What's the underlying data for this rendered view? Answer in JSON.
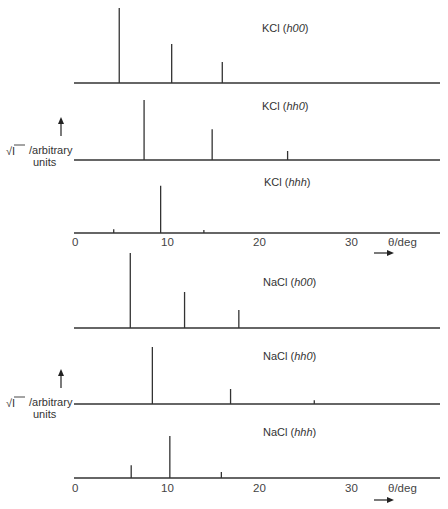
{
  "figure": {
    "y_axis_label_symbol": "√I",
    "y_axis_label_text": "/arbitrary",
    "y_axis_label_units": "units",
    "x_axis_label": "θ/deg",
    "x_ticks": [
      "0",
      "10",
      "20",
      "30"
    ]
  },
  "chart_data": [
    {
      "type": "bar",
      "title": "KCl (h00)",
      "group": "KCl",
      "xlabel": "θ/deg",
      "ylabel": "√I /arbitrary units",
      "xlim": [
        0,
        40
      ],
      "peaks": [
        {
          "theta": 4.7,
          "amplitude": 1.0
        },
        {
          "theta": 10.4,
          "amplitude": 0.52
        },
        {
          "theta": 15.9,
          "amplitude": 0.28
        }
      ]
    },
    {
      "type": "bar",
      "title": "KCl (hh0)",
      "group": "KCl",
      "xlabel": "θ/deg",
      "ylabel": "√I /arbitrary units",
      "xlim": [
        0,
        40
      ],
      "peaks": [
        {
          "theta": 7.4,
          "amplitude": 0.8
        },
        {
          "theta": 14.8,
          "amplitude": 0.41
        },
        {
          "theta": 23.0,
          "amplitude": 0.12
        }
      ]
    },
    {
      "type": "bar",
      "title": "KCl (hhh)",
      "group": "KCl",
      "xlabel": "θ/deg",
      "ylabel": "√I /arbitrary units",
      "xlim": [
        0,
        40
      ],
      "peaks": [
        {
          "theta": 4.1,
          "amplitude": 0.05
        },
        {
          "theta": 9.2,
          "amplitude": 0.63
        },
        {
          "theta": 13.9,
          "amplitude": 0.04
        }
      ]
    },
    {
      "type": "bar",
      "title": "NaCl (h00)",
      "group": "NaCl",
      "xlabel": "θ/deg",
      "ylabel": "√I /arbitrary units",
      "xlim": [
        0,
        40
      ],
      "peaks": [
        {
          "theta": 5.9,
          "amplitude": 1.0
        },
        {
          "theta": 11.8,
          "amplitude": 0.48
        },
        {
          "theta": 17.7,
          "amplitude": 0.24
        }
      ]
    },
    {
      "type": "bar",
      "title": "NaCl (hh0)",
      "group": "NaCl",
      "xlabel": "θ/deg",
      "ylabel": "√I /arbitrary units",
      "xlim": [
        0,
        40
      ],
      "peaks": [
        {
          "theta": 8.3,
          "amplitude": 0.76
        },
        {
          "theta": 16.8,
          "amplitude": 0.2
        },
        {
          "theta": 25.9,
          "amplitude": 0.05
        }
      ]
    },
    {
      "type": "bar",
      "title": "NaCl (hhh)",
      "group": "NaCl",
      "xlabel": "θ/deg",
      "ylabel": "√I /arbitrary units",
      "xlim": [
        0,
        40
      ],
      "peaks": [
        {
          "theta": 6.0,
          "amplitude": 0.17
        },
        {
          "theta": 10.2,
          "amplitude": 0.56
        },
        {
          "theta": 15.8,
          "amplitude": 0.08
        }
      ]
    }
  ],
  "panel_labels": [
    {
      "prefix": "KCl (",
      "hkl": "h00",
      "suffix": ")"
    },
    {
      "prefix": "KCl (",
      "hkl": "hh0",
      "suffix": ")"
    },
    {
      "prefix": "KCl (",
      "hkl": "hhh",
      "suffix": ")"
    },
    {
      "prefix": "NaCl (",
      "hkl": "h00",
      "suffix": ")"
    },
    {
      "prefix": "NaCl (",
      "hkl": "hh0",
      "suffix": ")"
    },
    {
      "prefix": "NaCl (",
      "hkl": "hhh",
      "suffix": ")"
    }
  ]
}
